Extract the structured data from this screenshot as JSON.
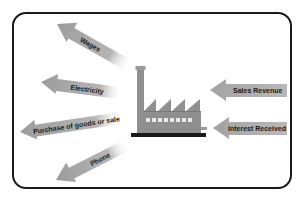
{
  "diagram": {
    "factory": {
      "label": "factory-icon"
    },
    "outflows": [
      {
        "label": "Wages"
      },
      {
        "label": "Electricity"
      },
      {
        "label": "Purchase of goods or sale"
      },
      {
        "label": "Phone"
      }
    ],
    "inflows": [
      {
        "label": "Sales Revenue"
      },
      {
        "label": "Interest Received"
      }
    ],
    "colors": {
      "arrow": "#a8a8a8",
      "frame": "#1a1a1a",
      "factory": "#8f8f8f",
      "factory_base": "#1a1a1a"
    }
  }
}
